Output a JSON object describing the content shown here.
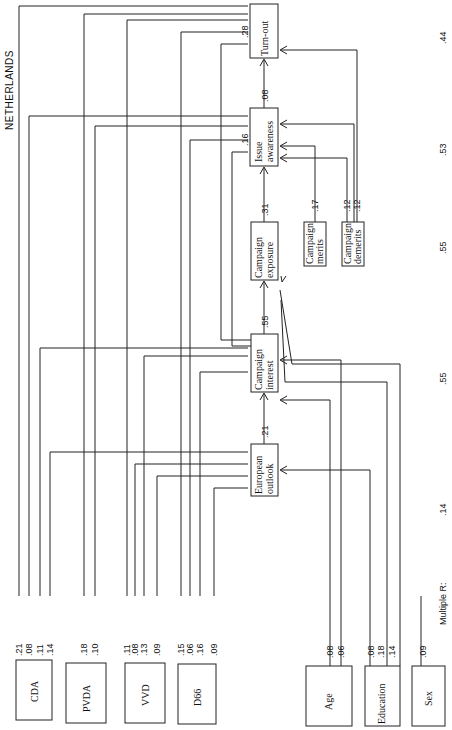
{
  "title": "NETHERLANDS",
  "multiple_r_label": "Multiple R:",
  "outcomes": [
    {
      "id": "european_outlook",
      "label_line1": "European",
      "label_line2": "outlook",
      "multiple_r": ".14",
      "path_to_next": ".21"
    },
    {
      "id": "campaign_interest",
      "label_line1": "Campaign",
      "label_line2": "interest",
      "multiple_r": ".55",
      "path_to_next": ".55"
    },
    {
      "id": "campaign_exposure",
      "label_line1": "Campaign",
      "label_line2": "exposure",
      "multiple_r": ".55",
      "path_to_next": ".31"
    },
    {
      "id": "issue_awareness",
      "label_line1": "Issue",
      "label_line2": "awareness",
      "multiple_r": ".53",
      "path_to_next": ".08"
    },
    {
      "id": "turn_out",
      "label_line1": "Turn-out",
      "label_line2": "",
      "multiple_r": ".44"
    }
  ],
  "side_inputs": [
    {
      "id": "campaign_merits",
      "label_line1": "Campaign",
      "label_line2": "merits",
      "coef": ".17"
    },
    {
      "id": "campaign_demerits",
      "label_line1": "Campaign",
      "label_line2": "demerits",
      "coefs": [
        ".12",
        ".12"
      ]
    }
  ],
  "extra_paths": {
    "interest_to_turnout": ".28",
    "interest_to_awareness": ".16"
  },
  "predictors": [
    {
      "id": "cda",
      "label": "CDA",
      "coefs": [
        ".21",
        ".08",
        ".11",
        ".14"
      ]
    },
    {
      "id": "pvda",
      "label": "PVDA",
      "coefs": [
        ".18",
        ".10"
      ]
    },
    {
      "id": "vvd",
      "label": "VVD",
      "coefs": [
        ".11",
        ".08",
        ".13",
        ".09"
      ]
    },
    {
      "id": "d66",
      "label": "D66",
      "coefs": [
        ".15",
        ".06",
        ".16",
        ".09"
      ]
    },
    {
      "id": "age",
      "label": "Age",
      "coefs": [
        ".08",
        ".06"
      ]
    },
    {
      "id": "education",
      "label": "Education",
      "coefs": [
        ".08",
        ".18",
        ".14"
      ]
    },
    {
      "id": "sex",
      "label": "Sex",
      "coefs": [
        ".09"
      ]
    }
  ]
}
